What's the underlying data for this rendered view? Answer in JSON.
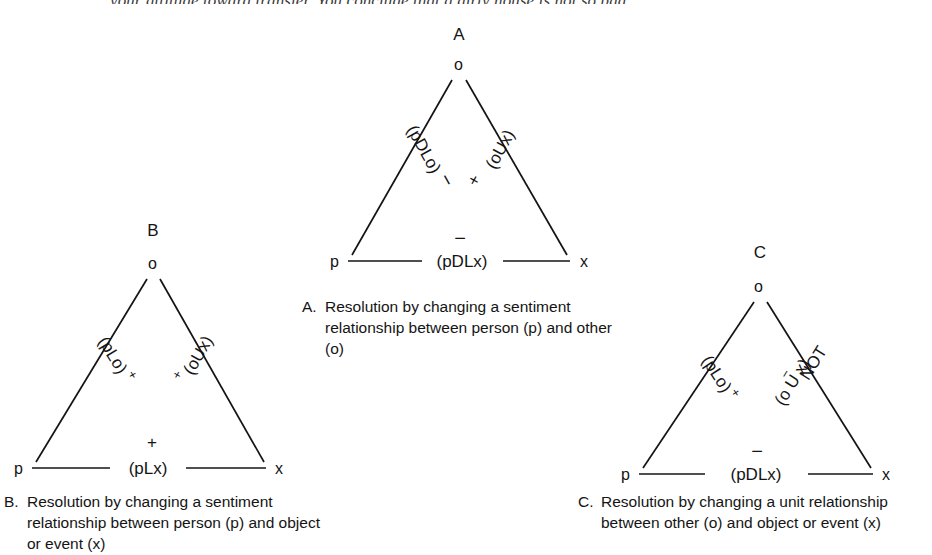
{
  "page": {
    "top_running_text": "your attitude toward transfer. You conclude that a dirty house is not so bad"
  },
  "figure": {
    "panels": [
      {
        "id": "A",
        "letter": "A",
        "apex_label": "o",
        "left_vertex_label": "p",
        "right_vertex_label": "x",
        "left_edge_label": "(pDLo)",
        "left_edge_sign": "−",
        "right_edge_label": "(oUx)",
        "right_edge_sign": "+",
        "bottom_edge_label": "(pDLx)",
        "bottom_edge_sign": "−",
        "caption_letter": "A.",
        "caption_text": "Resolution by changing a sentiment relationship between person (p) and other (o)"
      },
      {
        "id": "B",
        "letter": "B",
        "apex_label": "o",
        "left_vertex_label": "p",
        "right_vertex_label": "x",
        "left_edge_label": "(pLo)",
        "left_edge_sign": "+",
        "right_edge_label": "(oUx)",
        "right_edge_sign": "+",
        "bottom_edge_label": "(pLx)",
        "bottom_edge_sign": "+",
        "caption_letter": "B.",
        "caption_text": "Resolution by changing a sentiment relationship between person (p) and object or event (x)"
      },
      {
        "id": "C",
        "letter": "C",
        "apex_label": "o",
        "left_vertex_label": "p",
        "right_vertex_label": "x",
        "left_edge_label": "(pLo)",
        "left_edge_sign": "+",
        "right_edge_label_line1": "NOT",
        "right_edge_label_line2": "(o U x)",
        "right_edge_sign": "−",
        "bottom_edge_label": "(pDLx)",
        "bottom_edge_sign": "−",
        "caption_letter": "C.",
        "caption_text": "Resolution by changing a unit relationship between other (o) and object or event (x)"
      }
    ],
    "colors": {
      "ink": "#141414",
      "background": "#ffffff"
    }
  }
}
